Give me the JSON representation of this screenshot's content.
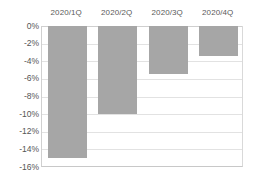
{
  "chart_data": {
    "type": "bar",
    "title": "",
    "subtitle": "",
    "xlabel": "",
    "ylabel": "",
    "categories": [
      "2020/1Q",
      "2020/2Q",
      "2020/3Q",
      "2020/4Q"
    ],
    "values": [
      -15.0,
      -10.0,
      -5.5,
      -3.4
    ],
    "value_labels": [
      "-15%",
      "-10%",
      "-5.5%",
      "-3.4%"
    ],
    "unit": "%",
    "ylim": [
      -16,
      0
    ],
    "ytick_values": [
      0,
      -2,
      -4,
      -6,
      -8,
      -10,
      -12,
      -14,
      -16
    ],
    "ytick_labels": [
      "0%",
      "-2%",
      "-4%",
      "-6%",
      "-8%",
      "-10%",
      "-12%",
      "-14%",
      "-16%"
    ],
    "grid": true,
    "grid_axis": "y",
    "legend": false,
    "legend_position": "none",
    "category_labels_position": "top",
    "bar_color": "#a6a6a6",
    "gridline_color": "#e2e2e2",
    "axis_color": "#c8c8c8",
    "tick_label_color": "#555555",
    "category_label_color": "#5a5a5a",
    "background_color": "#ffffff"
  }
}
